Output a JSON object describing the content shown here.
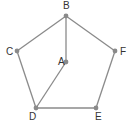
{
  "diagram": {
    "type": "graph",
    "colors": {
      "edge": "#8a8a8a",
      "node": "#8a8a8a",
      "label": "#333333"
    },
    "nodes": [
      {
        "id": "A",
        "label": "A",
        "x": 66,
        "y": 62,
        "lx": 58,
        "ly": 65
      },
      {
        "id": "B",
        "label": "B",
        "x": 66,
        "y": 16,
        "lx": 63,
        "ly": 9
      },
      {
        "id": "C",
        "label": "C",
        "x": 17,
        "y": 51,
        "lx": 6,
        "ly": 55
      },
      {
        "id": "D",
        "label": "D",
        "x": 36,
        "y": 108,
        "lx": 29,
        "ly": 120
      },
      {
        "id": "E",
        "label": "E",
        "x": 96,
        "y": 108,
        "lx": 95,
        "ly": 120
      },
      {
        "id": "F",
        "label": "F",
        "x": 115,
        "y": 51,
        "lx": 120,
        "ly": 55
      }
    ],
    "edges": [
      [
        "B",
        "C"
      ],
      [
        "B",
        "F"
      ],
      [
        "B",
        "A"
      ],
      [
        "C",
        "D"
      ],
      [
        "A",
        "D"
      ],
      [
        "D",
        "E"
      ],
      [
        "E",
        "F"
      ]
    ]
  }
}
